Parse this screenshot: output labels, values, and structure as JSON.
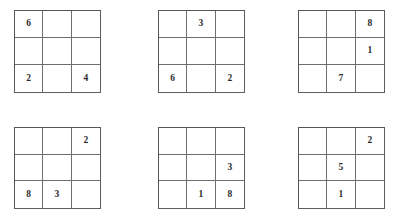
{
  "page": {
    "background_color": "#ffffff",
    "grid_line_color": "#6e6e6e",
    "border_color": "#565656",
    "digit_color": "#2b2b2b"
  },
  "grids": [
    {
      "id": "grid-1",
      "label": "Grid 1",
      "position": {
        "left": 14,
        "top": 10,
        "width": 87,
        "height": 83
      },
      "rows": [
        [
          "6",
          "",
          ""
        ],
        [
          "",
          "",
          ""
        ],
        [
          "2",
          "",
          "4"
        ]
      ]
    },
    {
      "id": "grid-2",
      "label": "Grid 2",
      "position": {
        "left": 158,
        "top": 10,
        "width": 87,
        "height": 83
      },
      "rows": [
        [
          "",
          "3",
          ""
        ],
        [
          "",
          "",
          ""
        ],
        [
          "6",
          "",
          "2"
        ]
      ]
    },
    {
      "id": "grid-3",
      "label": "Grid 3",
      "position": {
        "left": 298,
        "top": 10,
        "width": 87,
        "height": 83
      },
      "rows": [
        [
          "",
          "",
          "8"
        ],
        [
          "",
          "",
          "1"
        ],
        [
          "",
          "7",
          ""
        ]
      ]
    },
    {
      "id": "grid-4",
      "label": "Grid 4",
      "position": {
        "left": 14,
        "top": 127,
        "width": 87,
        "height": 82
      },
      "rows": [
        [
          "",
          "",
          "2"
        ],
        [
          "",
          "",
          ""
        ],
        [
          "8",
          "3",
          ""
        ]
      ]
    },
    {
      "id": "grid-5",
      "label": "Grid 5",
      "position": {
        "left": 158,
        "top": 127,
        "width": 87,
        "height": 82
      },
      "rows": [
        [
          "",
          "",
          ""
        ],
        [
          "",
          "",
          "3"
        ],
        [
          "",
          "1",
          "8"
        ]
      ]
    },
    {
      "id": "grid-6",
      "label": "Grid 6",
      "position": {
        "left": 298,
        "top": 127,
        "width": 87,
        "height": 82
      },
      "rows": [
        [
          "",
          "",
          "2"
        ],
        [
          "",
          "5",
          ""
        ],
        [
          "",
          "1",
          ""
        ]
      ]
    }
  ]
}
